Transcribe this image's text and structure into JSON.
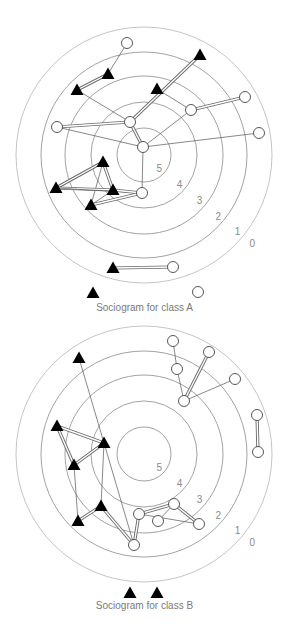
{
  "figure_a": {
    "caption": "Sociogram for class A",
    "center": [
      144,
      155
    ],
    "ring_radii": [
      128,
      103,
      79,
      53,
      27
    ],
    "ring_labels": [
      "0",
      "1",
      "2",
      "3",
      "4",
      "5"
    ],
    "nodes": [
      {
        "id": "a1",
        "type": "girl",
        "x": 127,
        "y": 43
      },
      {
        "id": "a2",
        "type": "boy",
        "x": 108,
        "y": 74
      },
      {
        "id": "a3",
        "type": "boy",
        "x": 77,
        "y": 90
      },
      {
        "id": "a4",
        "type": "boy",
        "x": 200,
        "y": 55
      },
      {
        "id": "a5",
        "type": "boy",
        "x": 157,
        "y": 89
      },
      {
        "id": "a6",
        "type": "girl",
        "x": 245,
        "y": 97
      },
      {
        "id": "a7",
        "type": "girl",
        "x": 191,
        "y": 110
      },
      {
        "id": "a8",
        "type": "girl",
        "x": 57,
        "y": 127
      },
      {
        "id": "a9",
        "type": "girl",
        "x": 130,
        "y": 122
      },
      {
        "id": "a10",
        "type": "girl",
        "x": 259,
        "y": 133
      },
      {
        "id": "a11",
        "type": "girl",
        "x": 143,
        "y": 147
      },
      {
        "id": "a12",
        "type": "boy",
        "x": 103,
        "y": 162
      },
      {
        "id": "a13",
        "type": "boy",
        "x": 56,
        "y": 188
      },
      {
        "id": "a14",
        "type": "boy",
        "x": 113,
        "y": 190
      },
      {
        "id": "a15",
        "type": "girl",
        "x": 142,
        "y": 193
      },
      {
        "id": "a16",
        "type": "boy",
        "x": 91,
        "y": 205
      },
      {
        "id": "a17",
        "type": "boy",
        "x": 113,
        "y": 268
      },
      {
        "id": "a18",
        "type": "girl",
        "x": 173,
        "y": 267
      }
    ],
    "isolates": [
      {
        "id": "a19",
        "type": "boy",
        "x": 93,
        "y": 293
      },
      {
        "id": "a20",
        "type": "girl",
        "x": 198,
        "y": 292
      }
    ],
    "edges": [
      {
        "from": "a1",
        "to": "a2",
        "mutual": false
      },
      {
        "from": "a2",
        "to": "a3",
        "mutual": true
      },
      {
        "from": "a3",
        "to": "a9",
        "mutual": false
      },
      {
        "from": "a4",
        "to": "a9",
        "mutual": true
      },
      {
        "from": "a5",
        "to": "a7",
        "mutual": false
      },
      {
        "from": "a7",
        "to": "a6",
        "mutual": true
      },
      {
        "from": "a7",
        "to": "a11",
        "mutual": false
      },
      {
        "from": "a8",
        "to": "a9",
        "mutual": true
      },
      {
        "from": "a8",
        "to": "a11",
        "mutual": false
      },
      {
        "from": "a9",
        "to": "a11",
        "mutual": true
      },
      {
        "from": "a11",
        "to": "a10",
        "mutual": false
      },
      {
        "from": "a11",
        "to": "a15",
        "mutual": false
      },
      {
        "from": "a12",
        "to": "a13",
        "mutual": true
      },
      {
        "from": "a12",
        "to": "a14",
        "mutual": true
      },
      {
        "from": "a12",
        "to": "a16",
        "mutual": false
      },
      {
        "from": "a13",
        "to": "a14",
        "mutual": true
      },
      {
        "from": "a13",
        "to": "a15",
        "mutual": false
      },
      {
        "from": "a14",
        "to": "a15",
        "mutual": true
      },
      {
        "from": "a14",
        "to": "a16",
        "mutual": false
      },
      {
        "from": "a16",
        "to": "a15",
        "mutual": true
      },
      {
        "from": "a17",
        "to": "a18",
        "mutual": true
      }
    ]
  },
  "figure_b": {
    "caption": "Sociogram for class B",
    "center": [
      144,
      454
    ],
    "ring_radii": [
      128,
      103,
      79,
      53,
      27
    ],
    "ring_labels": [
      "0",
      "1",
      "2",
      "3",
      "4",
      "5"
    ],
    "nodes": [
      {
        "id": "b1",
        "type": "girl",
        "x": 173,
        "y": 341
      },
      {
        "id": "b2",
        "type": "girl",
        "x": 209,
        "y": 352
      },
      {
        "id": "b3",
        "type": "boy",
        "x": 79,
        "y": 358
      },
      {
        "id": "b4",
        "type": "girl",
        "x": 177,
        "y": 369
      },
      {
        "id": "b5",
        "type": "girl",
        "x": 235,
        "y": 379
      },
      {
        "id": "b6",
        "type": "girl",
        "x": 184,
        "y": 401
      },
      {
        "id": "b7",
        "type": "girl",
        "x": 257,
        "y": 415
      },
      {
        "id": "b8",
        "type": "boy",
        "x": 57,
        "y": 426
      },
      {
        "id": "b9",
        "type": "boy",
        "x": 104,
        "y": 443
      },
      {
        "id": "b10",
        "type": "girl",
        "x": 258,
        "y": 452
      },
      {
        "id": "b11",
        "type": "boy",
        "x": 74,
        "y": 465
      },
      {
        "id": "b12",
        "type": "boy",
        "x": 101,
        "y": 506
      },
      {
        "id": "b13",
        "type": "boy",
        "x": 78,
        "y": 521
      },
      {
        "id": "b14",
        "type": "girl",
        "x": 174,
        "y": 504
      },
      {
        "id": "b15",
        "type": "girl",
        "x": 139,
        "y": 514
      },
      {
        "id": "b16",
        "type": "girl",
        "x": 158,
        "y": 521
      },
      {
        "id": "b17",
        "type": "girl",
        "x": 199,
        "y": 524
      },
      {
        "id": "b18",
        "type": "girl",
        "x": 134,
        "y": 545
      }
    ],
    "isolates": [
      {
        "id": "b19",
        "type": "boy",
        "x": 130,
        "y": 593
      },
      {
        "id": "b20",
        "type": "boy",
        "x": 157,
        "y": 593
      }
    ],
    "edges": [
      {
        "from": "b1",
        "to": "b4",
        "mutual": false
      },
      {
        "from": "b4",
        "to": "b6",
        "mutual": false
      },
      {
        "from": "b2",
        "to": "b6",
        "mutual": true
      },
      {
        "from": "b5",
        "to": "b6",
        "mutual": false
      },
      {
        "from": "b7",
        "to": "b10",
        "mutual": true
      },
      {
        "from": "b3",
        "to": "b9",
        "mutual": false
      },
      {
        "from": "b8",
        "to": "b9",
        "mutual": true
      },
      {
        "from": "b8",
        "to": "b11",
        "mutual": true
      },
      {
        "from": "b9",
        "to": "b11",
        "mutual": true
      },
      {
        "from": "b9",
        "to": "b12",
        "mutual": false
      },
      {
        "from": "b11",
        "to": "b13",
        "mutual": false
      },
      {
        "from": "b13",
        "to": "b12",
        "mutual": true
      },
      {
        "from": "b12",
        "to": "b18",
        "mutual": true
      },
      {
        "from": "b9",
        "to": "b18",
        "mutual": false
      },
      {
        "from": "b15",
        "to": "b18",
        "mutual": true
      },
      {
        "from": "b15",
        "to": "b14",
        "mutual": true
      },
      {
        "from": "b14",
        "to": "b16",
        "mutual": false
      },
      {
        "from": "b14",
        "to": "b17",
        "mutual": true
      },
      {
        "from": "b15",
        "to": "b17",
        "mutual": false
      }
    ]
  },
  "legend": {
    "boy_symbol": "filled-triangle",
    "girl_symbol": "open-circle",
    "mutual_edge": "double-line",
    "one_way_edge": "single-line"
  },
  "colors": {
    "rings": "#8a8a8a",
    "outer_ring": "#b5b5b5",
    "boy": "#000000",
    "girl_stroke": "#444444",
    "labels": "#8a8a8a"
  }
}
